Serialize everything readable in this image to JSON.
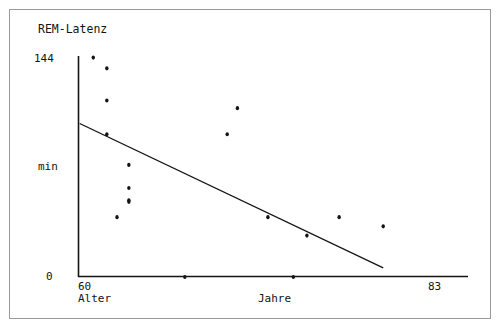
{
  "figure": {
    "title": "REM-Latenz",
    "background_color": "#ffffff",
    "ink_color": "#141414",
    "frame_color": "#9a9a9a"
  },
  "axes": {
    "y_axis": {
      "label": "min",
      "top_tick_label": "144",
      "bottom_tick_label": "0"
    },
    "x_axis": {
      "label": "Jahre",
      "left_tick_label": "60",
      "left_axis_name": "Alter",
      "right_tick_label": "83"
    }
  },
  "chart_data": {
    "type": "scatter",
    "title": "REM-Latenz",
    "xlabel": "Jahre",
    "ylabel": "min",
    "x_axis_name": "Alter",
    "xlim": [
      60,
      83
    ],
    "ylim": [
      0,
      144
    ],
    "grid": false,
    "legend": null,
    "x_tick_labels": [
      "60",
      "83"
    ],
    "y_tick_labels": [
      "0",
      "144"
    ],
    "points": [
      {
        "x": 60.9,
        "y": 143.0
      },
      {
        "x": 61.7,
        "y": 136.0
      },
      {
        "x": 61.7,
        "y": 115.0
      },
      {
        "x": 61.7,
        "y": 93.0
      },
      {
        "x": 63.0,
        "y": 73.0
      },
      {
        "x": 63.0,
        "y": 58.0
      },
      {
        "x": 63.0,
        "y": 50.0
      },
      {
        "x": 63.0,
        "y": 49.0
      },
      {
        "x": 62.3,
        "y": 39.0
      },
      {
        "x": 66.3,
        "y": 0.0
      },
      {
        "x": 68.8,
        "y": 93.0
      },
      {
        "x": 69.4,
        "y": 110.0
      },
      {
        "x": 71.2,
        "y": 39.0
      },
      {
        "x": 72.7,
        "y": 0.0
      },
      {
        "x": 73.5,
        "y": 27.0
      },
      {
        "x": 75.4,
        "y": 39.0
      },
      {
        "x": 78.0,
        "y": 33.0
      }
    ],
    "regression_line": {
      "label": "Regressionsgerade",
      "x_start": 60.1,
      "y_start": 100.0,
      "x_end": 78.0,
      "y_end": 6.0,
      "visible": true
    }
  }
}
